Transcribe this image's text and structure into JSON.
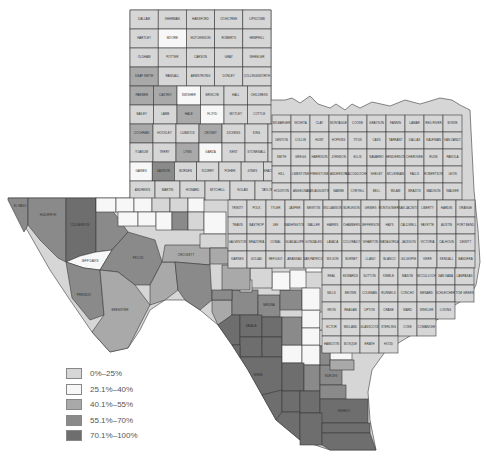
{
  "map": {
    "region": "Texas counties",
    "legend": [
      {
        "label": "0%–25%",
        "color": "#d6d6d6"
      },
      {
        "label": "25.1%–40%",
        "color": "#f7f7f7"
      },
      {
        "label": "40.1%–55%",
        "color": "#a9a9a9"
      },
      {
        "label": "55.1%–70%",
        "color": "#8a8a8a"
      },
      {
        "label": "70.1%–100%",
        "color": "#6e6e6e"
      }
    ],
    "panhandle_rows": [
      [
        "DALLAM",
        "SHERMAN",
        "HANSFORD",
        "OCHILTREE",
        "LIPSCOMB"
      ],
      [
        "HARTLEY",
        "MOORE",
        "HUTCHINSON",
        "ROBERTS",
        "HEMPHILL"
      ],
      [
        "OLDHAM",
        "POTTER",
        "CARSON",
        "GRAY",
        "WHEELER"
      ],
      [
        "DEAF SMITH",
        "RANDALL",
        "ARMSTRONG",
        "DONLEY",
        "COLLINGSWORTH"
      ],
      [
        "PARMER",
        "CASTRO",
        "SWISHER",
        "BRISCOE",
        "HALL",
        "CHILDRESS"
      ],
      [
        "BAILEY",
        "LAMB",
        "HALE",
        "FLOYD",
        "MOTLEY",
        "COTTLE"
      ],
      [
        "COCHRAN",
        "HOCKLEY",
        "LUBBOCK",
        "CROSBY",
        "DICKENS",
        "KING",
        "KNOX",
        "BAYLOR"
      ],
      [
        "YOAKUM",
        "TERRY",
        "LYNN",
        "GARZA",
        "KENT",
        "STONEWALL",
        "HASKELL",
        "THROCKMORTON"
      ],
      [
        "GAINES",
        "DAWSON",
        "BORDEN",
        "SCURRY",
        "FISHER",
        "JONES",
        "SHACKELFORD",
        "STEPHENS",
        "PALO PINTO"
      ],
      [
        "ANDREWS",
        "MARTIN",
        "HOWARD",
        "MITCHELL",
        "NOLAN",
        "TAYLOR",
        "CALLAHAN",
        "EASTLAND"
      ]
    ],
    "panhandle_shades": [
      [
        0,
        0,
        0,
        0,
        0
      ],
      [
        0,
        1,
        0,
        0,
        0
      ],
      [
        0,
        0,
        0,
        0,
        0
      ],
      [
        2,
        0,
        0,
        0,
        0
      ],
      [
        2,
        2,
        1,
        0,
        0,
        0
      ],
      [
        0,
        0,
        2,
        1,
        0,
        0
      ],
      [
        2,
        0,
        0,
        2,
        0,
        0,
        0,
        0
      ],
      [
        0,
        0,
        2,
        1,
        0,
        0,
        0,
        0
      ],
      [
        1,
        3,
        0,
        0,
        0,
        0,
        0,
        0,
        0
      ],
      [
        0,
        0,
        0,
        0,
        0,
        0,
        0,
        0
      ]
    ],
    "west_counties": [
      {
        "name": "EL PASO",
        "shade": 3
      },
      {
        "name": "HUDSPETH",
        "shade": 3
      },
      {
        "name": "CULBERSON",
        "shade": 4
      },
      {
        "name": "REEVES",
        "shade": 3
      },
      {
        "name": "JEFF DAVIS",
        "shade": 1
      },
      {
        "name": "PECOS",
        "shade": 3
      },
      {
        "name": "PRESIDIO",
        "shade": 3
      },
      {
        "name": "BREWSTER",
        "shade": 2
      },
      {
        "name": "TERRELL",
        "shade": 2
      },
      {
        "name": "CROCKETT",
        "shade": 2
      },
      {
        "name": "VAL VERDE",
        "shade": 3
      }
    ],
    "south_counties": [
      {
        "name": "KINNEY",
        "shade": 2
      },
      {
        "name": "UVALDE",
        "shade": 3
      },
      {
        "name": "MEDINA",
        "shade": 3
      },
      {
        "name": "MAVERICK",
        "shade": 4
      },
      {
        "name": "ZAVALA",
        "shade": 4
      },
      {
        "name": "FRIO",
        "shade": 4
      },
      {
        "name": "DIMMIT",
        "shade": 4
      },
      {
        "name": "LA SALLE",
        "shade": 4
      },
      {
        "name": "WEBB",
        "shade": 4
      },
      {
        "name": "DUVAL",
        "shade": 4
      },
      {
        "name": "JIM WELLS",
        "shade": 3
      },
      {
        "name": "ZAPATA",
        "shade": 4
      },
      {
        "name": "JIM HOGG",
        "shade": 4
      },
      {
        "name": "BROOKS",
        "shade": 4
      },
      {
        "name": "KLEBERG",
        "shade": 3
      },
      {
        "name": "STARR",
        "shade": 4
      },
      {
        "name": "HIDALGO",
        "shade": 4
      },
      {
        "name": "WILLACY",
        "shade": 4
      },
      {
        "name": "CAMERON",
        "shade": 4
      },
      {
        "name": "KENEDY",
        "shade": 4
      },
      {
        "name": "NUECES",
        "shade": 3
      },
      {
        "name": "BEXAR",
        "shade": 3
      },
      {
        "name": "ATASCOSA",
        "shade": 3
      },
      {
        "name": "MCMULLEN",
        "shade": 1
      },
      {
        "name": "LIVE OAK",
        "shade": 1
      }
    ],
    "central_east_labels": [
      "WILBARGER",
      "WICHITA",
      "CLAY",
      "MONTAGUE",
      "COOKE",
      "GRAYSON",
      "FANNIN",
      "LAMAR",
      "RED RIVER",
      "BOWIE",
      "DENTON",
      "COLLIN",
      "HUNT",
      "HOPKINS",
      "TITUS",
      "CASS",
      "TARRANT",
      "DALLAS",
      "KAUFMAN",
      "VAN ZANDT",
      "SMITH",
      "GREGG",
      "HARRISON",
      "JOHNSON",
      "ELLIS",
      "NAVARRO",
      "HENDERSON",
      "CHEROKEE",
      "RUSK",
      "PANOLA",
      "HILL",
      "LIMESTONE",
      "FREESTONE",
      "ANDERSON",
      "NACOGDOCHES",
      "SHELBY",
      "MCLENNAN",
      "FALLS",
      "ROBERTSON",
      "LEON",
      "HOUSTON",
      "ANGELINA",
      "SAN AUGUSTINE",
      "SABINE",
      "CORYELL",
      "BELL",
      "MILAM",
      "BRAZOS",
      "MADISON",
      "WALKER",
      "TRINITY",
      "POLK",
      "TYLER",
      "JASPER",
      "NEWTON",
      "WILLIAMSON",
      "BURLESON",
      "GRIMES",
      "MONTGOMERY",
      "SAN JACINTO",
      "LIBERTY",
      "HARDIN",
      "ORANGE",
      "TRAVIS",
      "BASTROP",
      "LEE",
      "WASHINGTON",
      "WALLER",
      "HARRIS",
      "CHAMBERS",
      "JEFFERSON",
      "HAYS",
      "CALDWELL",
      "FAYETTE",
      "AUSTIN",
      "FORT BEND",
      "GALVESTON",
      "BRAZORIA",
      "COMAL",
      "GUADALUPE",
      "GONZALES",
      "LAVACA",
      "COLORADO",
      "WHARTON",
      "MATAGORDA",
      "JACKSON",
      "VICTORIA",
      "CALHOUN",
      "DEWITT",
      "KARNES",
      "GOLIAD",
      "REFUGIO",
      "ARANSAS",
      "SAN PATRICIO",
      "WILSON",
      "BURNET",
      "LLANO",
      "BLANCO",
      "GILLESPIE",
      "KERR",
      "KENDALL",
      "BANDERA",
      "REAL",
      "EDWARDS",
      "SUTTON",
      "KIMBLE",
      "MASON",
      "MCCULLOCH",
      "SAN SABA",
      "LAMPASAS",
      "MILLS",
      "BROWN",
      "COLEMAN",
      "RUNNELS",
      "CONCHO",
      "MENARD",
      "SCHLEICHER",
      "TOM GREEN",
      "IRION",
      "REAGAN",
      "UPTON",
      "CRANE",
      "WARD",
      "WINKLER",
      "LOVING",
      "ECTOR",
      "MIDLAND",
      "GLASSCOCK",
      "STERLING",
      "COKE",
      "COMANCHE",
      "HAMILTON",
      "BOSQUE",
      "ERATH",
      "HOOD",
      "PARKER",
      "WISE",
      "JACK",
      "YOUNG",
      "ARCHER"
    ]
  }
}
